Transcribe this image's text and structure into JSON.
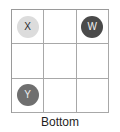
{
  "figure": {
    "caption": "Bottom",
    "grid": {
      "rows": 3,
      "columns": 3,
      "border_color": "#9a9a9a",
      "line_color": "#a8a8a8",
      "background": "#ffffff"
    },
    "cells": [
      {
        "row": 1,
        "col": 1,
        "label": "X",
        "token": true,
        "shade": "light",
        "fill": "#dcdcdc",
        "text_color": "#2b2b2b"
      },
      {
        "row": 1,
        "col": 2,
        "label": "",
        "token": false,
        "shade": "empty",
        "fill": "#ffffff",
        "text_color": ""
      },
      {
        "row": 1,
        "col": 3,
        "label": "W",
        "token": true,
        "shade": "dark",
        "fill": "#4a4a4a",
        "text_color": "#f2f2f2"
      },
      {
        "row": 2,
        "col": 1,
        "label": "",
        "token": false,
        "shade": "empty",
        "fill": "#ffffff",
        "text_color": ""
      },
      {
        "row": 2,
        "col": 2,
        "label": "",
        "token": false,
        "shade": "empty",
        "fill": "#ffffff",
        "text_color": ""
      },
      {
        "row": 2,
        "col": 3,
        "label": "",
        "token": false,
        "shade": "empty",
        "fill": "#ffffff",
        "text_color": ""
      },
      {
        "row": 3,
        "col": 1,
        "label": "Y",
        "token": true,
        "shade": "mid",
        "fill": "#6f6f6f",
        "text_color": "#ededed"
      },
      {
        "row": 3,
        "col": 2,
        "label": "",
        "token": false,
        "shade": "empty",
        "fill": "#ffffff",
        "text_color": ""
      },
      {
        "row": 3,
        "col": 3,
        "label": "",
        "token": false,
        "shade": "empty",
        "fill": "#ffffff",
        "text_color": ""
      }
    ]
  }
}
